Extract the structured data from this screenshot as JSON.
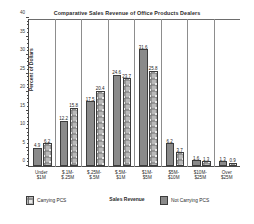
{
  "chart_data": {
    "type": "bar",
    "title": "Comparative Sales Revenue of Office Products Dealers",
    "xlabel": "Sales Revenue",
    "ylabel": "Percent of Dollars",
    "ylim": [
      0,
      40
    ],
    "yticks": [
      0,
      5,
      10,
      15,
      20,
      25,
      30,
      35,
      40
    ],
    "ytick_labels": [
      "0",
      "5",
      "10",
      "15",
      "20",
      "25",
      "30",
      "35",
      "40"
    ],
    "grid": false,
    "legend_position": "bottom",
    "categories": [
      "Under $1M",
      "$.1M-$.25M",
      "$.25M-$.5M",
      "$.5M-$1M",
      "$1M-$5M",
      "$5M-$10M",
      "$10M-$25M",
      "Over $25M"
    ],
    "series": [
      {
        "name": "Carrying PCS",
        "style": "pattern",
        "color": "#b9b9b9",
        "values": [
          6.2,
          15.8,
          20.4,
          23.7,
          25.8,
          3.7,
          1.3,
          0.9
        ]
      },
      {
        "name": "Not Carrying PCS",
        "style": "solid",
        "color": "#8a8a8a",
        "values": [
          4.9,
          12.2,
          17.5,
          24.6,
          31.6,
          6.2,
          1.6,
          1.3
        ]
      }
    ],
    "value_labels": {
      "not_carrying": [
        "4.9",
        "12.2",
        "17.5",
        "24.6",
        "31.6",
        "6.2",
        "1.6",
        "1.3"
      ],
      "carrying": [
        "6.2",
        "15.8",
        "20.4",
        "23.7",
        "25.8",
        "3.7",
        "1.3",
        "0.9"
      ]
    }
  },
  "legend": {
    "carrying_label": "Carrying PCS",
    "not_carrying_label": "Not Carrying PCS"
  }
}
